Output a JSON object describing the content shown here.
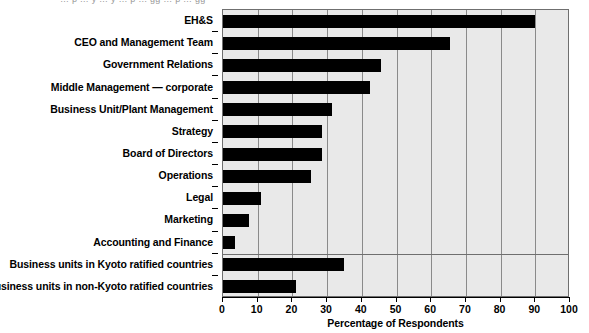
{
  "top_remnant": {
    "text": "… p … y … y … p … gg … p … gg"
  },
  "chart_data": {
    "type": "bar",
    "orientation": "horizontal",
    "title": "",
    "xlabel": "Percentage of Respondents",
    "ylabel": "",
    "xlim": [
      0,
      100
    ],
    "xticks": [
      0,
      10,
      20,
      30,
      40,
      50,
      60,
      70,
      80,
      90,
      100
    ],
    "xtick_labels": [
      "0",
      "10",
      "20",
      "30",
      "40",
      "50",
      "60",
      "70",
      "80",
      "90",
      "100"
    ],
    "grid": true,
    "grid_axis": "x",
    "legend": null,
    "bar_color": "#000000",
    "plot_background": "#e9e9e9",
    "grid_color": "#8a8a8a",
    "axis_color": "#000000",
    "categories": [
      "EH&S",
      "CEO and Management Team",
      "Government Relations",
      "Middle Management — corporate",
      "Business Unit/Plant Management",
      "Strategy",
      "Board of Directors",
      "Operations",
      "Legal",
      "Marketing",
      "Accounting and Finance",
      "Business units in Kyoto ratified countries",
      "Business units in non-Kyoto ratified countries"
    ],
    "values": [
      90,
      65.5,
      45.5,
      42.5,
      31.5,
      28.5,
      28.5,
      25.5,
      11,
      7.5,
      3.5,
      35,
      21
    ],
    "group_separator_after_index": 10
  }
}
